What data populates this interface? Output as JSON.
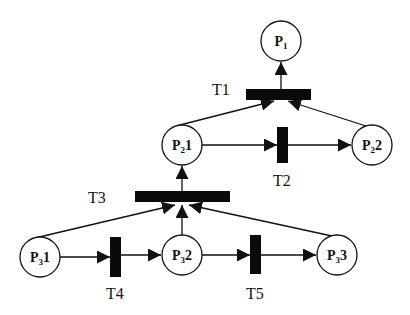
{
  "diagram": {
    "type": "petri-net",
    "colors": {
      "stroke": "#111111",
      "transition_fill": "#0a0a0a",
      "place_fill": "#ffffff",
      "background": "#ffffff"
    },
    "places": [
      {
        "id": "P1",
        "main": "P",
        "sub": "1",
        "suffix": "",
        "cx": 281,
        "cy": 41
      },
      {
        "id": "P21",
        "main": "P",
        "sub": "2",
        "suffix": "1",
        "cx": 182,
        "cy": 145
      },
      {
        "id": "P22",
        "main": "P",
        "sub": "2",
        "suffix": "2",
        "cx": 372,
        "cy": 145
      },
      {
        "id": "P31",
        "main": "P",
        "sub": "3",
        "suffix": "1",
        "cx": 40,
        "cy": 257
      },
      {
        "id": "P32",
        "main": "P",
        "sub": "3",
        "suffix": "2",
        "cx": 182,
        "cy": 255
      },
      {
        "id": "P33",
        "main": "P",
        "sub": "3",
        "suffix": "3",
        "cx": 337,
        "cy": 255
      }
    ],
    "transitions": [
      {
        "id": "T1",
        "label": "T1",
        "orientation": "horizontal"
      },
      {
        "id": "T2",
        "label": "T2",
        "orientation": "vertical"
      },
      {
        "id": "T3",
        "label": "T3",
        "orientation": "horizontal"
      },
      {
        "id": "T4",
        "label": "T4",
        "orientation": "vertical"
      },
      {
        "id": "T5",
        "label": "T5",
        "orientation": "vertical"
      }
    ],
    "arcs": [
      {
        "from": "P21",
        "to": "T1"
      },
      {
        "from": "P22",
        "to": "T1"
      },
      {
        "from": "T1",
        "to": "P1"
      },
      {
        "from": "P21",
        "to": "T2"
      },
      {
        "from": "T2",
        "to": "P22"
      },
      {
        "from": "P31",
        "to": "T3"
      },
      {
        "from": "P32",
        "to": "T3"
      },
      {
        "from": "P33",
        "to": "T3"
      },
      {
        "from": "T3",
        "to": "P21"
      },
      {
        "from": "P31",
        "to": "T4"
      },
      {
        "from": "T4",
        "to": "P32"
      },
      {
        "from": "P32",
        "to": "T5"
      },
      {
        "from": "T5",
        "to": "P33"
      }
    ]
  }
}
